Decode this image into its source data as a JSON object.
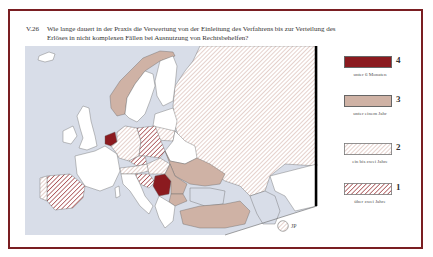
{
  "figure": {
    "number": "V.26",
    "question": "Wie lange dauert in der Praxis die Verwertung von der Einleitung des Verfahrens bis zur Verteilung des Erlöses in nicht komplexen Fällen bei Ausnutzung von Rechtsbehelfen?"
  },
  "colors": {
    "frame": "#7a1e22",
    "sea": "#d8dde8",
    "land_nodata": "#ffffff",
    "level4": "#8b1a1f",
    "level3": "#cfb2a5",
    "level2_hatch": "#d7b8b0",
    "level1_hatch": "#a4484c",
    "border_line": "#555555"
  },
  "legend": [
    {
      "level": "4",
      "label": "unter 6 Monaten",
      "pattern": "solid-dark-red"
    },
    {
      "level": "3",
      "label": "unter einem Jahr",
      "pattern": "solid-tan"
    },
    {
      "level": "2",
      "label": "ein bis zwei Jahre",
      "pattern": "light-hatch"
    },
    {
      "level": "1",
      "label": "über zwei Jahre",
      "pattern": "dark-hatch"
    }
  ],
  "inset": {
    "label": "JP",
    "pattern": "light-hatch"
  },
  "map_data": {
    "level4": [
      "Netherlands",
      "Serbia"
    ],
    "level3": [
      "Norway",
      "Ukraine",
      "Romania",
      "Bulgaria",
      "Turkey",
      "Moldova"
    ],
    "level2": [
      "Russia",
      "Belgium/Germany",
      "Hungary",
      "Austria",
      "Portugal",
      "Lithuania"
    ],
    "level1": [
      "Spain",
      "Poland",
      "Czech Republic",
      "Croatia"
    ],
    "no_data": [
      "Iceland",
      "United Kingdom",
      "Ireland",
      "France",
      "Sweden",
      "Finland",
      "Italy",
      "Belarus",
      "Greece",
      "Kazakhstan"
    ]
  }
}
